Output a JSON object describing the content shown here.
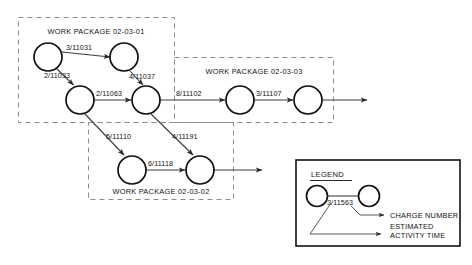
{
  "diagram": {
    "type": "activity-network-diagram",
    "work_packages": [
      {
        "id": "wp-02-03-01",
        "label": "WORK PACKAGE 02-03-01"
      },
      {
        "id": "wp-02-03-02",
        "label": "WORK PACKAGE 02-03-02"
      },
      {
        "id": "wp-02-03-03",
        "label": "WORK PACKAGE 02-03-03"
      }
    ],
    "edge_labels": {
      "n1_n2": "3/11031",
      "n1_n3": "2/11033",
      "n2_n4": "4/11037",
      "n3_n4": "2/11063",
      "n4_n5": "8/11102",
      "n5_n6": "3/11107",
      "n3_n7": "5/11110",
      "n4_n8": "4/11191",
      "n7_n8": "6/11118"
    },
    "legend": {
      "title": "LEGEND",
      "sample_label": "3/11563",
      "note_charge_number": "CHARGE NUMBER",
      "note_estimated": "ESTIMATED",
      "note_activity_time": "ACTIVITY TIME"
    },
    "colors": {
      "node_stroke": "#111111",
      "edge_stroke": "#3c3c3c",
      "dashed_box_stroke": "#8d8d8d",
      "legend_border": "#111111",
      "background": "#ffffff"
    }
  }
}
